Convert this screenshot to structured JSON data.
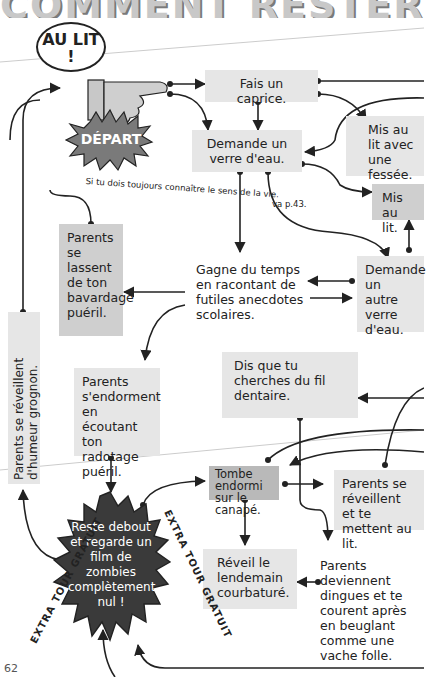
{
  "page": {
    "title": "COMMENT RESTER DEBOUT",
    "page_number": "62"
  },
  "start": {
    "bubble": "AU LIT !",
    "badge": "DÉPART"
  },
  "nodes": {
    "caprice": "Fais un caprice.",
    "verre": "Demande un verre d'eau.",
    "fessee": "Mis au lit avec une fessée.",
    "mis_au_lit": "Mis au lit.",
    "lassent": "Parents se lassent de ton bavardage puéril.",
    "gagne": "Gagne du temps en racontant de futiles anecdotes scolaires.",
    "autre_verre": "Demande un autre verre d'eau.",
    "endorment": "Parents s'endorment en écoutant ton radotage puéril.",
    "fil": "Dis que tu cherches du fil dentaire.",
    "tombe": "Tombe endormi sur le canapé.",
    "reveillent_lit": "Parents se réveillent et te mettent au lit.",
    "reveil": "Réveil le lendemain courbaturé.",
    "dingues": "Parents deviennent dingues et te courent après en beuglant comme une vache folle.",
    "grognon": "Parents se réveillent d'humeur grognon.",
    "zombies": "Reste debout et regarde un film de zombies complètement nul !"
  },
  "annotations": {
    "sens_vie": "Si tu dois toujours connaître le sens de la vie.",
    "va_page": "va p.43.",
    "extra_left": "EXTRA TOUR GRATUIT",
    "extra_right": "EXTRA TOUR GRATUIT"
  },
  "colors": {
    "light_box": "#e6e6e6",
    "mid_box": "#cfcfcf",
    "dark_box": "#b9b9b9",
    "star_dark": "#3a3a3a",
    "depart_star": "#7a7a7a",
    "line": "#222222"
  }
}
